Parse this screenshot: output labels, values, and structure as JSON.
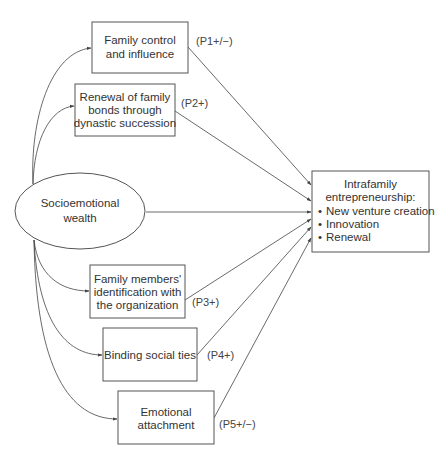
{
  "diagram": {
    "source": {
      "id": "socioemotional-wealth",
      "lines": [
        "Socioemotional",
        "wealth"
      ]
    },
    "dimensions": [
      {
        "id": "family-control",
        "lines": [
          "Family control",
          "and influence"
        ],
        "proposition": "(P1+/−)"
      },
      {
        "id": "renewal-bonds",
        "lines": [
          "Renewal of family",
          "bonds through",
          "dynastic succession"
        ],
        "proposition": "(P2+)"
      },
      {
        "id": "identification",
        "lines": [
          "Family members'",
          "identification with",
          "the organization"
        ],
        "proposition": "(P3+)"
      },
      {
        "id": "binding-ties",
        "lines": [
          "Binding social ties"
        ],
        "proposition": "(P4+)"
      },
      {
        "id": "emotional-attachment",
        "lines": [
          "Emotional",
          "attachment"
        ],
        "proposition": "(P5+/−)"
      }
    ],
    "outcome": {
      "id": "intrafamily-entrepreneurship",
      "title_lines": [
        "Intrafamily",
        "entrepreneurship:"
      ],
      "bullets": [
        "New venture creation",
        "Innovation",
        "Renewal"
      ],
      "bullet_glyph": "•"
    }
  }
}
